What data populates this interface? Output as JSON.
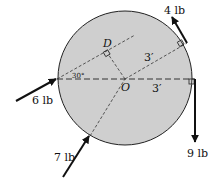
{
  "diagram": {
    "colors": {
      "disk_fill": "#cfcfcf",
      "stroke": "#111111",
      "background": "#ffffff"
    },
    "labels": {
      "center": "O",
      "point_d": "D",
      "angle": "30°",
      "radius_upper": "3′",
      "radius_lower": "3′"
    },
    "forces": [
      {
        "label": "6 lb",
        "name": "force-6lb"
      },
      {
        "label": "7 lb",
        "name": "force-7lb"
      },
      {
        "label": "4 lb",
        "name": "force-4lb"
      },
      {
        "label": "9 lb",
        "name": "force-9lb"
      }
    ]
  }
}
